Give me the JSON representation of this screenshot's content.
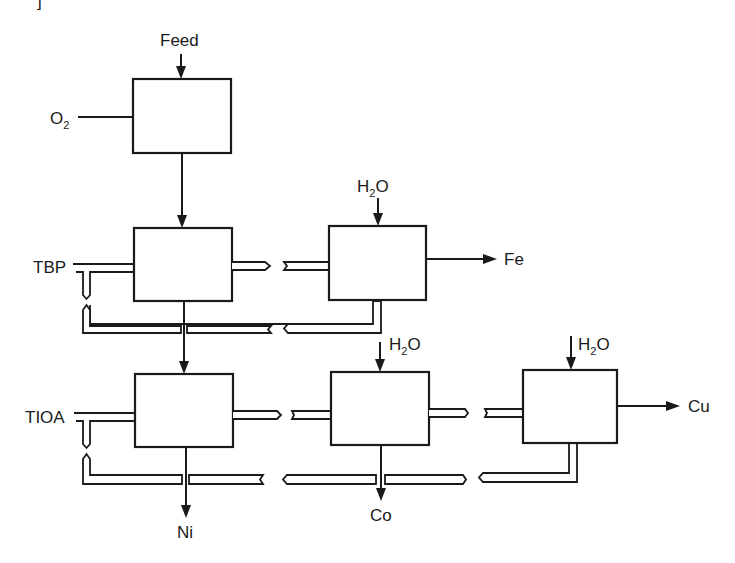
{
  "diagram": {
    "type": "process-flowsheet",
    "corner_mark": "]",
    "inputs": {
      "feed": "Feed",
      "oxygen": {
        "main": "O",
        "subscript": "2"
      },
      "extractant_1": "TBP",
      "extractant_2": "TIOA",
      "water_1": {
        "main": "H",
        "subscript": "2",
        "tail": "O"
      },
      "water_2": {
        "main": "H",
        "subscript": "2",
        "tail": "O"
      },
      "water_3": {
        "main": "H",
        "subscript": "2",
        "tail": "O"
      }
    },
    "outputs": {
      "iron": "Fe",
      "nickel": "Ni",
      "cobalt": "Co",
      "copper": "Cu"
    },
    "units": [
      {
        "id": "leach",
        "row": 1,
        "col": 1,
        "inputs": [
          "Feed",
          "O2"
        ]
      },
      {
        "id": "tbp-extraction",
        "row": 2,
        "col": 1,
        "inputs": [
          "leach liquor",
          "TBP"
        ]
      },
      {
        "id": "fe-strip",
        "row": 2,
        "col": 2,
        "inputs": [
          "H2O",
          "loaded TBP"
        ],
        "outputs": [
          "Fe"
        ]
      },
      {
        "id": "tioa-extraction",
        "row": 3,
        "col": 1,
        "inputs": [
          "raffinate",
          "TIOA"
        ],
        "outputs": [
          "Ni"
        ]
      },
      {
        "id": "co-strip",
        "row": 3,
        "col": 2,
        "inputs": [
          "H2O",
          "loaded TIOA"
        ],
        "outputs": [
          "Co"
        ]
      },
      {
        "id": "cu-strip",
        "row": 3,
        "col": 3,
        "inputs": [
          "H2O",
          "organic"
        ],
        "outputs": [
          "Cu"
        ]
      }
    ],
    "edges": [
      [
        "Feed",
        "leach"
      ],
      [
        "O2",
        "leach"
      ],
      [
        "leach",
        "tbp-extraction"
      ],
      [
        "TBP",
        "tbp-extraction"
      ],
      [
        "tbp-extraction",
        "fe-strip"
      ],
      [
        "H2O",
        "fe-strip"
      ],
      [
        "fe-strip",
        "Fe"
      ],
      [
        "fe-strip",
        "tbp-extraction",
        "organic recycle"
      ],
      [
        "tbp-extraction",
        "tioa-extraction"
      ],
      [
        "TIOA",
        "tioa-extraction"
      ],
      [
        "tioa-extraction",
        "co-strip"
      ],
      [
        "H2O",
        "co-strip"
      ],
      [
        "co-strip",
        "cu-strip"
      ],
      [
        "H2O",
        "cu-strip"
      ],
      [
        "cu-strip",
        "Cu"
      ],
      [
        "tioa-extraction",
        "Ni"
      ],
      [
        "co-strip",
        "Co"
      ],
      [
        "cu-strip",
        "tioa-extraction",
        "organic recycle"
      ]
    ]
  }
}
